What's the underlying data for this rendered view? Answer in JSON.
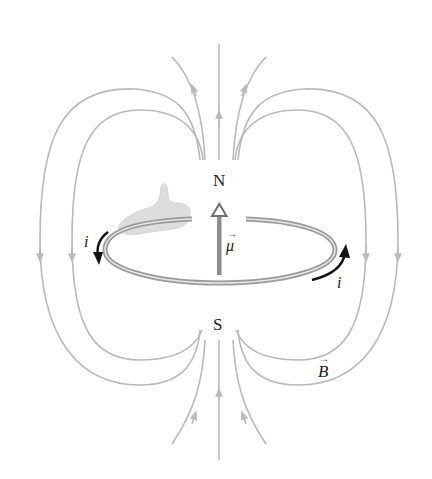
{
  "figure": {
    "type": "magnetic-dipole-current-loop",
    "labels": {
      "north_pole": "N",
      "south_pole": "S",
      "magnetic_moment": "μ",
      "current_left": "i",
      "current_right": "i",
      "field": "B",
      "vector_arrow": "→"
    },
    "colors": {
      "field_lines": "#b9b9b9",
      "loop_outer": "#9a9a9a",
      "loop_inner": "#e6e6e6",
      "moment_arrow": "#8c8c8c",
      "current_arrows": "#111111",
      "text": "#222222",
      "hand": "#d4d4d4"
    }
  }
}
